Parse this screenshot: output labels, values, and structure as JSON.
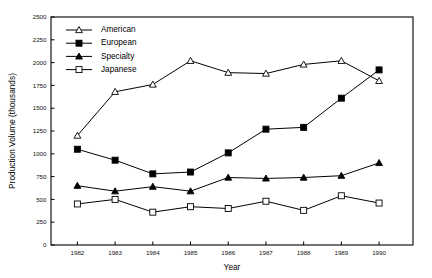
{
  "chart_data": {
    "type": "line",
    "title": "",
    "xlabel": "Year",
    "ylabel": "Production Volume (thousands)",
    "x": [
      1982,
      1983,
      1984,
      1985,
      1986,
      1987,
      1988,
      1989,
      1990
    ],
    "xtick_labels": [
      "1982",
      "1983",
      "1984",
      "1985",
      "1986",
      "1987",
      "1988",
      "1989",
      "1990"
    ],
    "ytick_labels": [
      "0",
      "250",
      "500",
      "750",
      "1000",
      "1250",
      "1500",
      "1750",
      "2000",
      "2250",
      "2500"
    ],
    "ytick_values": [
      0,
      250,
      500,
      750,
      1000,
      1250,
      1500,
      1750,
      2000,
      2250,
      2500
    ],
    "xlim": [
      1981.3,
      1990.9
    ],
    "ylim": [
      0,
      2500
    ],
    "grid": false,
    "legend_position": "upper-left-inside",
    "series": [
      {
        "name": "American",
        "marker": "triangle-open",
        "color": "#000000",
        "values": [
          1200,
          1680,
          1760,
          2020,
          1890,
          1880,
          1980,
          2020,
          1800
        ]
      },
      {
        "name": "European",
        "marker": "square-filled",
        "color": "#000000",
        "values": [
          1050,
          930,
          780,
          800,
          1010,
          1270,
          1290,
          1610,
          1920
        ]
      },
      {
        "name": "Specialty",
        "marker": "triangle-filled",
        "color": "#000000",
        "values": [
          650,
          590,
          640,
          590,
          740,
          730,
          740,
          760,
          900
        ]
      },
      {
        "name": "Japanese",
        "marker": "square-open",
        "color": "#000000",
        "values": [
          450,
          500,
          360,
          420,
          400,
          480,
          380,
          540,
          460
        ]
      }
    ]
  }
}
